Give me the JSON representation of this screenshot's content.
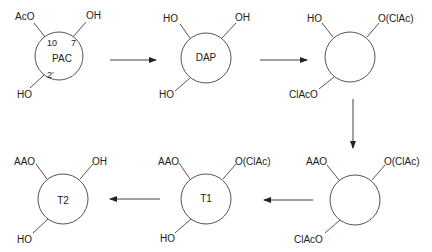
{
  "diagram": {
    "type": "reaction-scheme",
    "molecules": [
      {
        "id": "pac",
        "name": "PAC",
        "substituents": {
          "top_left": "AcO",
          "top_right": "OH",
          "bottom_left": "HO"
        },
        "positions": [
          "10",
          "7",
          "2′"
        ]
      },
      {
        "id": "dap",
        "name": "DAP",
        "substituents": {
          "top_left": "HO",
          "top_right": "OH",
          "bottom_left": "HO"
        }
      },
      {
        "id": "int1",
        "name": "",
        "substituents": {
          "top_left": "HO",
          "top_right": "O(ClAc)",
          "bottom_left": "ClAcO"
        }
      },
      {
        "id": "int2",
        "name": "",
        "substituents": {
          "top_left": "AAO",
          "top_right": "O(ClAc)",
          "bottom_left": "ClAcO"
        }
      },
      {
        "id": "t1",
        "name": "T1",
        "substituents": {
          "top_left": "AAO",
          "top_right": "O(ClAc)",
          "bottom_left": "HO"
        }
      },
      {
        "id": "t2",
        "name": "T2",
        "substituents": {
          "top_left": "AAO",
          "top_right": "OH",
          "bottom_left": "HO"
        }
      }
    ],
    "arrows": [
      {
        "from": "pac",
        "to": "dap",
        "direction": "right"
      },
      {
        "from": "dap",
        "to": "int1",
        "direction": "right"
      },
      {
        "from": "int1",
        "to": "int2",
        "direction": "down"
      },
      {
        "from": "int2",
        "to": "t1",
        "direction": "left"
      },
      {
        "from": "t1",
        "to": "t2",
        "direction": "left"
      }
    ]
  }
}
